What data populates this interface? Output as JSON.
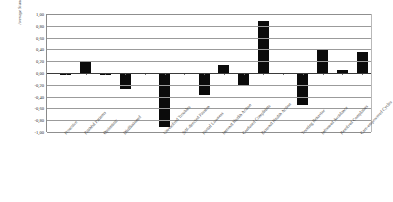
{
  "chart_data": {
    "type": "bar",
    "title": "",
    "xlabel": "",
    "ylabel": "Average Standard Score",
    "ylim": [
      -1.0,
      1.0
    ],
    "ytick_labels": [
      "1,00",
      "0,80",
      "0,60",
      "0,40",
      "0,20",
      "0,00",
      "-0,20",
      "-0,40",
      "-0,60",
      "-0,80",
      "-1,00"
    ],
    "ytick_values": [
      1.0,
      0.8,
      0.6,
      0.4,
      0.2,
      0.0,
      -0.2,
      -0.4,
      -0.6,
      -0.8,
      -1.0
    ],
    "grid": true,
    "legend": "none",
    "categories": [
      "Proactive",
      "Faithful Patients",
      "Optimistic",
      "Disillusioned",
      "Unresolved Troubles",
      "Self-directed Passion",
      "Partial Lowness",
      "Internal Health Action",
      "Confused Complaints",
      "External Health Action",
      "Trusting Behavior",
      "Informed Avoidance",
      "Resolved Complaints",
      "Care-empowered Cycles"
    ],
    "values": [
      -0.04,
      0.2,
      -0.03,
      -0.27,
      -0.92,
      -0.02,
      -0.37,
      0.13,
      -0.22,
      0.88,
      -0.55,
      0.4,
      0.05,
      0.36
    ],
    "group_breaks": [
      4,
      10
    ],
    "bar_color": "#0b0b0b"
  }
}
